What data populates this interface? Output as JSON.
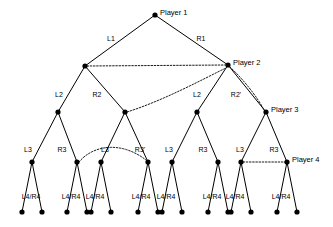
{
  "figure": {
    "background_color": "#ffffff",
    "line_color": "#000000",
    "node_color": "#000000"
  },
  "players": [
    {
      "id": "player-1",
      "label": "Player 1",
      "x": 155,
      "y": 15,
      "label_x": 160,
      "label_y": 13
    },
    {
      "id": "player-2",
      "label": "Player 2",
      "x": 228,
      "y": 65,
      "label_x": 233,
      "label_y": 63
    },
    {
      "id": "player-3",
      "label": "Player 3",
      "x": 266,
      "y": 112,
      "label_x": 271,
      "label_y": 110
    },
    {
      "id": "player-4",
      "label": "Player 4",
      "x": 287,
      "y": 162,
      "label_x": 292,
      "label_y": 160
    }
  ],
  "nodes": {
    "level0": [
      {
        "x": 155,
        "y": 15
      }
    ],
    "level1": [
      {
        "x": 85,
        "y": 66
      },
      {
        "x": 228,
        "y": 65
      }
    ],
    "level2": [
      {
        "x": 58,
        "y": 112
      },
      {
        "x": 125,
        "y": 112
      },
      {
        "x": 197,
        "y": 112
      },
      {
        "x": 266,
        "y": 112
      }
    ],
    "level3": [
      {
        "x": 32,
        "y": 162
      },
      {
        "x": 77,
        "y": 162
      },
      {
        "x": 101,
        "y": 162
      },
      {
        "x": 148,
        "y": 162
      },
      {
        "x": 172,
        "y": 162
      },
      {
        "x": 218,
        "y": 162
      },
      {
        "x": 241,
        "y": 162
      },
      {
        "x": 287,
        "y": 162
      }
    ],
    "level4": [
      {
        "x": 22,
        "y": 212
      },
      {
        "x": 42,
        "y": 212
      },
      {
        "x": 67,
        "y": 212
      },
      {
        "x": 87,
        "y": 212
      },
      {
        "x": 91,
        "y": 212
      },
      {
        "x": 111,
        "y": 212
      },
      {
        "x": 138,
        "y": 212
      },
      {
        "x": 158,
        "y": 212
      },
      {
        "x": 162,
        "y": 212
      },
      {
        "x": 182,
        "y": 212
      },
      {
        "x": 208,
        "y": 212
      },
      {
        "x": 228,
        "y": 212
      },
      {
        "x": 231,
        "y": 212
      },
      {
        "x": 251,
        "y": 212
      },
      {
        "x": 277,
        "y": 212
      },
      {
        "x": 297,
        "y": 212
      }
    ],
    "radius": 2.6
  },
  "edges": [
    {
      "from": [
        155,
        15
      ],
      "to": [
        85,
        66
      ]
    },
    {
      "from": [
        155,
        15
      ],
      "to": [
        228,
        65
      ]
    },
    {
      "from": [
        85,
        66
      ],
      "to": [
        58,
        112
      ]
    },
    {
      "from": [
        85,
        66
      ],
      "to": [
        125,
        112
      ]
    },
    {
      "from": [
        228,
        65
      ],
      "to": [
        197,
        112
      ]
    },
    {
      "from": [
        228,
        65
      ],
      "to": [
        266,
        112
      ]
    },
    {
      "from": [
        58,
        112
      ],
      "to": [
        32,
        162
      ]
    },
    {
      "from": [
        58,
        112
      ],
      "to": [
        77,
        162
      ]
    },
    {
      "from": [
        125,
        112
      ],
      "to": [
        101,
        162
      ]
    },
    {
      "from": [
        125,
        112
      ],
      "to": [
        148,
        162
      ]
    },
    {
      "from": [
        197,
        112
      ],
      "to": [
        172,
        162
      ]
    },
    {
      "from": [
        197,
        112
      ],
      "to": [
        218,
        162
      ]
    },
    {
      "from": [
        266,
        112
      ],
      "to": [
        241,
        162
      ]
    },
    {
      "from": [
        266,
        112
      ],
      "to": [
        287,
        162
      ]
    },
    {
      "from": [
        32,
        162
      ],
      "to": [
        22,
        212
      ]
    },
    {
      "from": [
        32,
        162
      ],
      "to": [
        42,
        212
      ]
    },
    {
      "from": [
        77,
        162
      ],
      "to": [
        67,
        212
      ]
    },
    {
      "from": [
        77,
        162
      ],
      "to": [
        87,
        212
      ]
    },
    {
      "from": [
        101,
        162
      ],
      "to": [
        91,
        212
      ]
    },
    {
      "from": [
        101,
        162
      ],
      "to": [
        111,
        212
      ]
    },
    {
      "from": [
        148,
        162
      ],
      "to": [
        138,
        212
      ]
    },
    {
      "from": [
        148,
        162
      ],
      "to": [
        158,
        212
      ]
    },
    {
      "from": [
        172,
        162
      ],
      "to": [
        162,
        212
      ]
    },
    {
      "from": [
        172,
        162
      ],
      "to": [
        182,
        212
      ]
    },
    {
      "from": [
        218,
        162
      ],
      "to": [
        208,
        212
      ]
    },
    {
      "from": [
        218,
        162
      ],
      "to": [
        228,
        212
      ]
    },
    {
      "from": [
        241,
        162
      ],
      "to": [
        231,
        212
      ]
    },
    {
      "from": [
        241,
        162
      ],
      "to": [
        251,
        212
      ]
    },
    {
      "from": [
        287,
        162
      ],
      "to": [
        277,
        212
      ]
    },
    {
      "from": [
        287,
        162
      ],
      "to": [
        297,
        212
      ]
    }
  ],
  "dotted_links": [
    {
      "name": "link-level1",
      "d": "M 87,66 L 226,65"
    },
    {
      "name": "link-level2",
      "d": "M 127,112 C 165,100 205,78 226,68"
    },
    {
      "name": "link-level2-right",
      "d": "M 230,67 C 244,80 258,98 264,110"
    },
    {
      "name": "link-level3-left",
      "d": "M 79,162 C 92,146 120,140 146,160"
    },
    {
      "name": "link-level3-right",
      "d": "M 243,162 L 285,162"
    }
  ],
  "edge_labels": [
    {
      "id": "l1",
      "text": "L1",
      "x": 111,
      "y": 38
    },
    {
      "id": "r1",
      "text": "R1",
      "x": 201,
      "y": 38
    },
    {
      "id": "l2-a",
      "text": "L2",
      "x": 59,
      "y": 94
    },
    {
      "id": "r2-a",
      "text": "R2",
      "x": 97,
      "y": 94
    },
    {
      "id": "l2-b",
      "text": "L2",
      "x": 197,
      "y": 94
    },
    {
      "id": "r2-b",
      "text": "R2'",
      "x": 236,
      "y": 94
    },
    {
      "id": "l3-a",
      "text": "L3",
      "x": 28,
      "y": 149
    },
    {
      "id": "r3-a",
      "text": "R3",
      "x": 62,
      "y": 149
    },
    {
      "id": "l3-b",
      "text": "L3",
      "x": 105,
      "y": 149
    },
    {
      "id": "r3-b",
      "text": "R3'",
      "x": 140,
      "y": 149
    },
    {
      "id": "l3-c",
      "text": "L3",
      "x": 169,
      "y": 149
    },
    {
      "id": "r3-c",
      "text": "R3",
      "x": 203,
      "y": 149
    },
    {
      "id": "l3-d",
      "text": "L3",
      "x": 240,
      "y": 149
    },
    {
      "id": "r3-d",
      "text": "R3",
      "x": 274,
      "y": 149
    }
  ],
  "leaf_labels": [
    {
      "id": "leaf-1",
      "text": "L4/R4",
      "x": 31,
      "y": 196
    },
    {
      "id": "leaf-2",
      "text": "L4/R4",
      "x": 71,
      "y": 196
    },
    {
      "id": "leaf-3",
      "text": "L4/R4",
      "x": 95,
      "y": 196
    },
    {
      "id": "leaf-4",
      "text": "L4/R4",
      "x": 141,
      "y": 196
    },
    {
      "id": "leaf-5",
      "text": "L4/R4",
      "x": 166,
      "y": 196
    },
    {
      "id": "leaf-6",
      "text": "L4/R4",
      "x": 212,
      "y": 196
    },
    {
      "id": "leaf-7",
      "text": "L4/R4",
      "x": 235,
      "y": 196
    },
    {
      "id": "leaf-8",
      "text": "L4/R4",
      "x": 281,
      "y": 196
    }
  ]
}
